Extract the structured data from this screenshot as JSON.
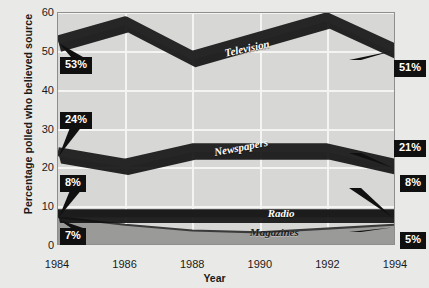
{
  "chart_data": {
    "type": "line",
    "title": "",
    "xlabel": "Year",
    "ylabel": "Percentage polled who believed source",
    "x": [
      1984,
      1985,
      1986,
      1987,
      1988,
      1989,
      1990,
      1991,
      1992,
      1993,
      1994
    ],
    "categories": [
      "1984",
      "1986",
      "1988",
      "1990",
      "1992",
      "1994"
    ],
    "xticks": [
      1984,
      1986,
      1988,
      1990,
      1992,
      1994
    ],
    "yticks": [
      0,
      10,
      20,
      30,
      40,
      50,
      60
    ],
    "xlim": [
      1984,
      1994
    ],
    "ylim": [
      0,
      60
    ],
    "grid": true,
    "legend": "inline-labels",
    "series": [
      {
        "name": "Television",
        "color": "#262626",
        "x": [
          1984,
          1986,
          1988,
          1992,
          1994
        ],
        "values": [
          53,
          58,
          49,
          59,
          51
        ],
        "start_value": 53,
        "end_value": 51
      },
      {
        "name": "Newspapers",
        "color": "#262626",
        "x": [
          1984,
          1986,
          1988,
          1992,
          1994
        ],
        "values": [
          24,
          21,
          25,
          25,
          21
        ],
        "start_value": 24,
        "end_value": 21
      },
      {
        "name": "Radio",
        "color": "#1c1c1c",
        "x": [
          1984,
          1986,
          1988,
          1990,
          1992,
          1994
        ],
        "values": [
          8,
          8,
          8,
          8,
          8,
          8
        ],
        "start_value": 8,
        "end_value": 8
      },
      {
        "name": "Magazines",
        "color": "#9a9a98",
        "x": [
          1984,
          1986,
          1988,
          1990,
          1992,
          1994
        ],
        "values": [
          7,
          5,
          3.5,
          3,
          4,
          5
        ],
        "start_value": 7,
        "end_value": 5
      }
    ],
    "annotations": [
      {
        "text": "53%",
        "series": "Television",
        "side": "left",
        "value": 53
      },
      {
        "text": "51%",
        "series": "Television",
        "side": "right",
        "value": 51
      },
      {
        "text": "24%",
        "series": "Newspapers",
        "side": "left",
        "value": 24
      },
      {
        "text": "21%",
        "series": "Newspapers",
        "side": "right",
        "value": 21
      },
      {
        "text": "8%",
        "series": "Radio",
        "side": "left",
        "value": 8
      },
      {
        "text": "8%",
        "series": "Radio",
        "side": "right",
        "value": 8
      },
      {
        "text": "7%",
        "series": "Magazines",
        "side": "left",
        "value": 7
      },
      {
        "text": "5%",
        "series": "Magazines",
        "side": "right",
        "value": 5
      }
    ]
  },
  "axes": {
    "y_title": "Percentage polled who believed source",
    "x_title": "Year",
    "y_tick_labels": [
      "60",
      "50",
      "40",
      "30",
      "20",
      "10",
      "0"
    ],
    "x_tick_labels": [
      "1984",
      "1986",
      "1988",
      "1990",
      "1992",
      "1994"
    ]
  },
  "series_labels": {
    "television": "Television",
    "newspapers": "Newspapers",
    "radio": "Radio",
    "magazines": "Magazines"
  },
  "callouts": {
    "tv_left": "53%",
    "tv_right": "51%",
    "news_left": "24%",
    "news_right": "21%",
    "radio_left": "8%",
    "radio_right": "8%",
    "mag_left": "7%",
    "mag_right": "5%"
  },
  "colors": {
    "background": "#e9e9e7",
    "plot_background": "#d7d7d5",
    "gridline": "#f4f4f2",
    "dark_series": "#262626",
    "light_series": "#9a9a98",
    "callout_background": "#101010",
    "callout_text": "#ffffff"
  }
}
